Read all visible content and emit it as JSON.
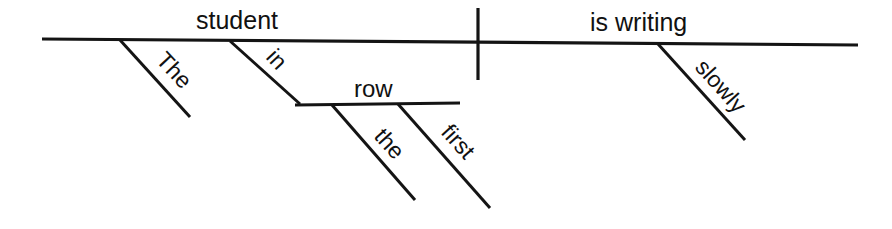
{
  "diagram": {
    "type": "reed-kellogg-sentence-diagram",
    "sentence": "The student in the first row is writing slowly.",
    "ink_color": "#141414",
    "background_color": "#ffffff",
    "baseline": {
      "name": "main-baseline",
      "x1": 42,
      "y1": 39,
      "x2": 858,
      "y2": 45
    },
    "divider": {
      "name": "subject-predicate-divider",
      "x1": 478,
      "y1": 8,
      "x2": 478,
      "y2": 80
    },
    "secondary_baseline": {
      "name": "prepositional-object-line",
      "x1": 295,
      "y1": 105,
      "x2": 460,
      "y2": 103
    },
    "labels": {
      "subject": "student",
      "verb": "is writing",
      "subject_article": "The",
      "preposition": "in",
      "prep_object": "row",
      "object_article": "the",
      "object_adjective": "first",
      "verb_adverb": "slowly"
    },
    "slots": [
      {
        "name": "subject",
        "text": "student",
        "x": 196,
        "y": 29,
        "rotate": 0,
        "role": "subject-noun"
      },
      {
        "name": "verb",
        "text": "is writing",
        "x": 590,
        "y": 31,
        "rotate": 0,
        "role": "verb-phrase"
      },
      {
        "name": "prep-object",
        "text": "row",
        "x": 354,
        "y": 97,
        "rotate": 0,
        "role": "object-of-preposition"
      },
      {
        "name": "subject-article",
        "text": "The",
        "x": 155,
        "y": 61,
        "rotate": 47,
        "role": "article-modifier"
      },
      {
        "name": "preposition",
        "text": "in",
        "x": 265,
        "y": 58,
        "rotate": 47,
        "role": "preposition"
      },
      {
        "name": "object-article",
        "text": "the",
        "x": 373,
        "y": 137,
        "rotate": 48,
        "role": "article-modifier"
      },
      {
        "name": "object-adjective",
        "text": "first",
        "x": 440,
        "y": 133,
        "rotate": 48,
        "role": "adjective-modifier"
      },
      {
        "name": "verb-adverb",
        "text": "slowly",
        "x": 694,
        "y": 68,
        "rotate": 48,
        "role": "adverb-modifier"
      }
    ],
    "branches": [
      {
        "name": "branch-the",
        "x1": 120,
        "y1": 40,
        "x2": 190,
        "y2": 117
      },
      {
        "name": "branch-in",
        "x1": 230,
        "y1": 41,
        "x2": 300,
        "y2": 104
      },
      {
        "name": "branch-the2",
        "x1": 332,
        "y1": 105,
        "x2": 415,
        "y2": 200
      },
      {
        "name": "branch-first",
        "x1": 398,
        "y1": 104,
        "x2": 490,
        "y2": 208
      },
      {
        "name": "branch-slowly",
        "x1": 658,
        "y1": 44,
        "x2": 745,
        "y2": 140
      }
    ]
  }
}
